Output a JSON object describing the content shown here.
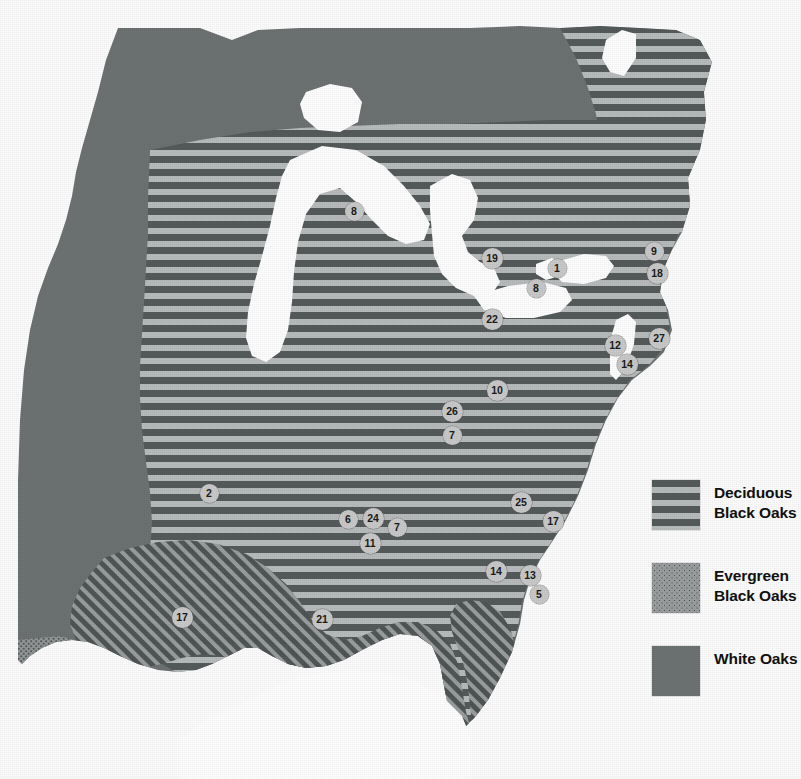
{
  "map": {
    "title": "Oak species distribution map of the eastern United States",
    "background_color": "#ffffff",
    "regions": [
      {
        "name": "white-oaks",
        "label": "White Oaks",
        "fill": "#6d7272",
        "pattern": "solid"
      },
      {
        "name": "deciduous-black-oaks",
        "label": "Deciduous Black Oaks",
        "fill": "#555b5b",
        "pattern": "horizontal-stripes"
      },
      {
        "name": "evergreen-black-oaks",
        "label": "Evergreen Black Oaks",
        "fill": "#9a9e9e",
        "pattern": "stipple-dots"
      },
      {
        "name": "great-lakes",
        "label": "Great Lakes",
        "fill": "#ffffff",
        "pattern": "solid"
      }
    ]
  },
  "legend": {
    "items": [
      {
        "key": "deciduous",
        "line1": "Deciduous",
        "line2": "Black Oaks",
        "swatch": "horizontal-stripes"
      },
      {
        "key": "evergreen",
        "line1": "Evergreen",
        "line2": "Black Oaks",
        "swatch": "stipple-dots"
      },
      {
        "key": "white",
        "line1": "White Oaks",
        "line2": "",
        "swatch": "solid"
      }
    ]
  },
  "markers": [
    {
      "id": "m01",
      "value": "8",
      "x": 354,
      "y": 211,
      "size": "d1"
    },
    {
      "id": "m02",
      "value": "19",
      "x": 492,
      "y": 258,
      "size": "d2"
    },
    {
      "id": "m03",
      "value": "1",
      "x": 557,
      "y": 268,
      "size": "d1"
    },
    {
      "id": "m04",
      "value": "8",
      "x": 536,
      "y": 288,
      "size": "d1"
    },
    {
      "id": "m05",
      "value": "9",
      "x": 654,
      "y": 251,
      "size": "d1"
    },
    {
      "id": "m06",
      "value": "18",
      "x": 657,
      "y": 273,
      "size": "d2"
    },
    {
      "id": "m07",
      "value": "22",
      "x": 492,
      "y": 319,
      "size": "d2"
    },
    {
      "id": "m08",
      "value": "27",
      "x": 659,
      "y": 338,
      "size": "d2"
    },
    {
      "id": "m09",
      "value": "12",
      "x": 615,
      "y": 345,
      "size": "d2"
    },
    {
      "id": "m10",
      "value": "14",
      "x": 627,
      "y": 364,
      "size": "d2"
    },
    {
      "id": "m11",
      "value": "10",
      "x": 497,
      "y": 390,
      "size": "d2"
    },
    {
      "id": "m12",
      "value": "26",
      "x": 452,
      "y": 411,
      "size": "d2"
    },
    {
      "id": "m13",
      "value": "7",
      "x": 452,
      "y": 435,
      "size": "d1"
    },
    {
      "id": "m14",
      "value": "2",
      "x": 209,
      "y": 493,
      "size": "d1"
    },
    {
      "id": "m15",
      "value": "25",
      "x": 521,
      "y": 502,
      "size": "d2"
    },
    {
      "id": "m16",
      "value": "6",
      "x": 348,
      "y": 519,
      "size": "d1"
    },
    {
      "id": "m17",
      "value": "24",
      "x": 373,
      "y": 518,
      "size": "d2"
    },
    {
      "id": "m18",
      "value": "7",
      "x": 397,
      "y": 527,
      "size": "d1"
    },
    {
      "id": "m19",
      "value": "17",
      "x": 553,
      "y": 521,
      "size": "d2"
    },
    {
      "id": "m20",
      "value": "11",
      "x": 370,
      "y": 543,
      "size": "d2"
    },
    {
      "id": "m21",
      "value": "14",
      "x": 496,
      "y": 571,
      "size": "d2"
    },
    {
      "id": "m22",
      "value": "13",
      "x": 530,
      "y": 575,
      "size": "d2"
    },
    {
      "id": "m23",
      "value": "5",
      "x": 539,
      "y": 594,
      "size": "d1"
    },
    {
      "id": "m24",
      "value": "17",
      "x": 182,
      "y": 617,
      "size": "d2"
    },
    {
      "id": "m25",
      "value": "21",
      "x": 322,
      "y": 619,
      "size": "d2"
    }
  ]
}
